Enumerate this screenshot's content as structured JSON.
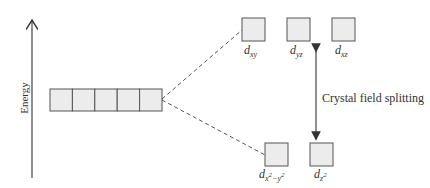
{
  "diagram": {
    "type": "crystal-field-splitting",
    "axis_label": "Energy",
    "splitting_label": "Crystal field splitting",
    "degenerate_orbitals": {
      "count": 5
    },
    "upper_set": [
      {
        "sub": "xy"
      },
      {
        "sub": "yz"
      },
      {
        "sub": "xz"
      }
    ],
    "lower_set": [
      {
        "sub": "x",
        "sup1": "2",
        "mid": "−y",
        "sup2": "2"
      },
      {
        "sub": "z",
        "sup1": "2"
      }
    ],
    "colors": {
      "box_fill": "#ececec",
      "box_stroke": "#555555",
      "line": "#444444"
    }
  }
}
